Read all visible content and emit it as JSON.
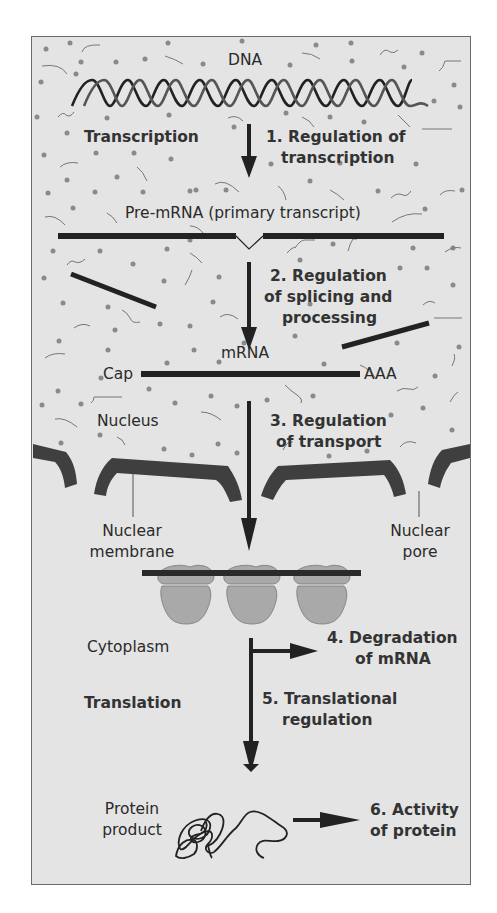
{
  "diagram": {
    "colors": {
      "background": "#e4e4e4",
      "border": "#6a6a6a",
      "strand": "#222222",
      "membrane": "#3f3f3f",
      "ribosome": "#a9a9a9",
      "dots": "#8a8a8a"
    },
    "molecules": {
      "dna": "DNA",
      "pre_mrna": "Pre-mRNA (primary transcript)",
      "mrna": "mRNA",
      "cap": "Cap",
      "poly_a": "AAA",
      "protein_line1": "Protein",
      "protein_line2": "product"
    },
    "processes": {
      "transcription": "Transcription",
      "translation": "Translation"
    },
    "compartments": {
      "nucleus": "Nucleus",
      "cytoplasm": "Cytoplasm",
      "nuclear_membrane_line1": "Nuclear",
      "nuclear_membrane_line2": "membrane",
      "nuclear_pore_line1": "Nuclear",
      "nuclear_pore_line2": "pore"
    },
    "regulation_steps": [
      {
        "line1": "1. Regulation of",
        "line2": "transcription"
      },
      {
        "line1": "2. Regulation",
        "line2": "of splicing and",
        "line3": "processing"
      },
      {
        "line1": "3. Regulation",
        "line2": "of transport"
      },
      {
        "line1": "4. Degradation",
        "line2": "of mRNA"
      },
      {
        "line1": "5. Translational",
        "line2": "regulation"
      },
      {
        "line1": "6. Activity",
        "line2": "of protein"
      }
    ]
  }
}
